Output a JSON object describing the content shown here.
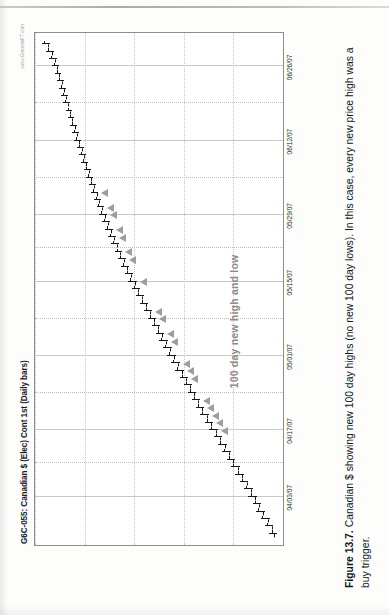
{
  "page": {
    "kind": "book-page-scan"
  },
  "caption": {
    "label": "Figure 13.7.",
    "text": "Canadian $ showing new 100 day highs (no new 100 day lows). In this case, every new price high was a buy trigger."
  },
  "chart_meta": {
    "title": "G6C-055: Canadian $ (Elec) Cont 1st (Daily bars)",
    "watermark": "www.GenesisFT.com",
    "annotation": "100 day new high and low",
    "bar_color": "#18181a",
    "trigger_color": "#9d9d9d",
    "grid_color": "#bdbdbd",
    "frame_color": "#8d8d8d"
  },
  "chart_data": {
    "type": "ohlc",
    "title": "G6C-055: Canadian $ (Elec) Cont 1st (Daily bars)",
    "xlabel": "",
    "ylabel": "",
    "grid": true,
    "legend": "none",
    "orientation": "page-rotated-90-ccw",
    "xlim": [
      "03/26/07",
      "07/03/07"
    ],
    "ylim": [
      0.855,
      0.955
    ],
    "xticks": [
      "04/03/07",
      "04/17/07",
      "05/01/07",
      "05/15/07",
      "05/29/07",
      "06/12/07",
      "06/26/07"
    ],
    "annotations": [
      {
        "text": "100 day new high and low",
        "x": "05/02/07",
        "y": 0.874
      }
    ],
    "series": [
      {
        "name": "Canadian $ Continuous 1st",
        "bars": [
          {
            "date": "03/27/07",
            "open": 0.8588,
            "high": 0.8605,
            "low": 0.8575,
            "close": 0.8596,
            "trigger": false
          },
          {
            "date": "03/28/07",
            "open": 0.8596,
            "high": 0.8622,
            "low": 0.859,
            "close": 0.8614,
            "trigger": false
          },
          {
            "date": "03/29/07",
            "open": 0.8612,
            "high": 0.864,
            "low": 0.8604,
            "close": 0.8633,
            "trigger": false
          },
          {
            "date": "03/30/07",
            "open": 0.8631,
            "high": 0.8658,
            "low": 0.8622,
            "close": 0.865,
            "trigger": false
          },
          {
            "date": "04/02/07",
            "open": 0.8648,
            "high": 0.8672,
            "low": 0.8639,
            "close": 0.8662,
            "trigger": false
          },
          {
            "date": "04/03/07",
            "open": 0.8661,
            "high": 0.869,
            "low": 0.8654,
            "close": 0.8681,
            "trigger": false
          },
          {
            "date": "04/04/07",
            "open": 0.868,
            "high": 0.8706,
            "low": 0.8671,
            "close": 0.8698,
            "trigger": false
          },
          {
            "date": "04/05/07",
            "open": 0.8697,
            "high": 0.8724,
            "low": 0.869,
            "close": 0.8716,
            "trigger": false
          },
          {
            "date": "04/09/07",
            "open": 0.8715,
            "high": 0.8742,
            "low": 0.8707,
            "close": 0.8733,
            "trigger": false
          },
          {
            "date": "04/10/07",
            "open": 0.8732,
            "high": 0.876,
            "low": 0.8724,
            "close": 0.8752,
            "trigger": false
          },
          {
            "date": "04/11/07",
            "open": 0.875,
            "high": 0.8776,
            "low": 0.8742,
            "close": 0.8768,
            "trigger": false
          },
          {
            "date": "04/12/07",
            "open": 0.8767,
            "high": 0.8795,
            "low": 0.8759,
            "close": 0.8786,
            "trigger": false
          },
          {
            "date": "04/13/07",
            "open": 0.8785,
            "high": 0.8812,
            "low": 0.8777,
            "close": 0.8804,
            "trigger": false
          },
          {
            "date": "04/16/07",
            "open": 0.8803,
            "high": 0.883,
            "low": 0.8795,
            "close": 0.8822,
            "trigger": false
          },
          {
            "date": "04/17/07",
            "open": 0.8821,
            "high": 0.8848,
            "low": 0.8813,
            "close": 0.884,
            "trigger": true
          },
          {
            "date": "04/18/07",
            "open": 0.8839,
            "high": 0.8866,
            "low": 0.8831,
            "close": 0.8858,
            "trigger": true
          },
          {
            "date": "04/19/07",
            "open": 0.8857,
            "high": 0.8884,
            "low": 0.8849,
            "close": 0.8876,
            "trigger": true
          },
          {
            "date": "04/20/07",
            "open": 0.8875,
            "high": 0.8902,
            "low": 0.8867,
            "close": 0.8894,
            "trigger": true
          },
          {
            "date": "04/23/07",
            "open": 0.8893,
            "high": 0.8918,
            "low": 0.8884,
            "close": 0.891,
            "trigger": true
          },
          {
            "date": "04/24/07",
            "open": 0.8908,
            "high": 0.8934,
            "low": 0.89,
            "close": 0.8926,
            "trigger": false
          },
          {
            "date": "04/25/07",
            "open": 0.8925,
            "high": 0.895,
            "low": 0.8916,
            "close": 0.8942,
            "trigger": false
          },
          {
            "date": "04/26/07",
            "open": 0.894,
            "high": 0.8966,
            "low": 0.8932,
            "close": 0.8958,
            "trigger": true
          },
          {
            "date": "04/27/07",
            "open": 0.8957,
            "high": 0.8984,
            "low": 0.8949,
            "close": 0.8976,
            "trigger": true
          },
          {
            "date": "04/30/07",
            "open": 0.8974,
            "high": 0.9,
            "low": 0.8966,
            "close": 0.8992,
            "trigger": true
          },
          {
            "date": "05/01/07",
            "open": 0.899,
            "high": 0.9016,
            "low": 0.8982,
            "close": 0.9008,
            "trigger": false
          },
          {
            "date": "05/02/07",
            "open": 0.9007,
            "high": 0.9032,
            "low": 0.8998,
            "close": 0.9024,
            "trigger": false
          },
          {
            "date": "05/03/07",
            "open": 0.9022,
            "high": 0.9048,
            "low": 0.9014,
            "close": 0.904,
            "trigger": true
          },
          {
            "date": "05/04/07",
            "open": 0.9038,
            "high": 0.9064,
            "low": 0.903,
            "close": 0.9056,
            "trigger": true
          },
          {
            "date": "05/07/07",
            "open": 0.9055,
            "high": 0.908,
            "low": 0.9046,
            "close": 0.9072,
            "trigger": false
          },
          {
            "date": "05/08/07",
            "open": 0.907,
            "high": 0.9096,
            "low": 0.9062,
            "close": 0.9088,
            "trigger": true
          },
          {
            "date": "05/09/07",
            "open": 0.9086,
            "high": 0.9112,
            "low": 0.9078,
            "close": 0.9104,
            "trigger": true
          },
          {
            "date": "05/10/07",
            "open": 0.9103,
            "high": 0.9128,
            "low": 0.9094,
            "close": 0.912,
            "trigger": false
          },
          {
            "date": "05/11/07",
            "open": 0.9118,
            "high": 0.9144,
            "low": 0.911,
            "close": 0.9136,
            "trigger": false
          },
          {
            "date": "05/14/07",
            "open": 0.9134,
            "high": 0.9158,
            "low": 0.9126,
            "close": 0.915,
            "trigger": false
          },
          {
            "date": "05/15/07",
            "open": 0.9148,
            "high": 0.9174,
            "low": 0.914,
            "close": 0.9166,
            "trigger": true
          },
          {
            "date": "05/16/07",
            "open": 0.9164,
            "high": 0.9188,
            "low": 0.9156,
            "close": 0.918,
            "trigger": false
          },
          {
            "date": "05/17/07",
            "open": 0.9178,
            "high": 0.9202,
            "low": 0.917,
            "close": 0.9194,
            "trigger": false
          },
          {
            "date": "05/18/07",
            "open": 0.9192,
            "high": 0.9216,
            "low": 0.9184,
            "close": 0.9208,
            "trigger": true
          },
          {
            "date": "05/21/07",
            "open": 0.9206,
            "high": 0.9228,
            "low": 0.9198,
            "close": 0.922,
            "trigger": true
          },
          {
            "date": "05/22/07",
            "open": 0.9219,
            "high": 0.9242,
            "low": 0.9211,
            "close": 0.9234,
            "trigger": false
          },
          {
            "date": "05/23/07",
            "open": 0.9232,
            "high": 0.9254,
            "low": 0.9224,
            "close": 0.9246,
            "trigger": true
          },
          {
            "date": "05/24/07",
            "open": 0.9244,
            "high": 0.9266,
            "low": 0.9236,
            "close": 0.9258,
            "trigger": true
          },
          {
            "date": "05/25/07",
            "open": 0.9256,
            "high": 0.9278,
            "low": 0.9248,
            "close": 0.927,
            "trigger": false
          },
          {
            "date": "05/29/07",
            "open": 0.9268,
            "high": 0.929,
            "low": 0.926,
            "close": 0.9282,
            "trigger": true
          },
          {
            "date": "05/30/07",
            "open": 0.928,
            "high": 0.9302,
            "low": 0.9272,
            "close": 0.9294,
            "trigger": true
          },
          {
            "date": "05/31/07",
            "open": 0.9292,
            "high": 0.9312,
            "low": 0.9284,
            "close": 0.9304,
            "trigger": false
          },
          {
            "date": "06/01/07",
            "open": 0.9302,
            "high": 0.9324,
            "low": 0.9294,
            "close": 0.9316,
            "trigger": true
          },
          {
            "date": "06/04/07",
            "open": 0.9314,
            "high": 0.9334,
            "low": 0.9306,
            "close": 0.9326,
            "trigger": false
          },
          {
            "date": "06/05/07",
            "open": 0.9324,
            "high": 0.9344,
            "low": 0.9316,
            "close": 0.9336,
            "trigger": false
          },
          {
            "date": "06/06/07",
            "open": 0.9334,
            "high": 0.9354,
            "low": 0.9326,
            "close": 0.9346,
            "trigger": false
          },
          {
            "date": "06/07/07",
            "open": 0.9344,
            "high": 0.9364,
            "low": 0.9336,
            "close": 0.9356,
            "trigger": false
          },
          {
            "date": "06/08/07",
            "open": 0.9354,
            "high": 0.9372,
            "low": 0.9346,
            "close": 0.9364,
            "trigger": false
          },
          {
            "date": "06/11/07",
            "open": 0.9362,
            "high": 0.9382,
            "low": 0.9354,
            "close": 0.9374,
            "trigger": false
          },
          {
            "date": "06/12/07",
            "open": 0.9372,
            "high": 0.9392,
            "low": 0.9364,
            "close": 0.9384,
            "trigger": false
          },
          {
            "date": "06/13/07",
            "open": 0.9382,
            "high": 0.94,
            "low": 0.9374,
            "close": 0.9392,
            "trigger": false
          },
          {
            "date": "06/14/07",
            "open": 0.939,
            "high": 0.941,
            "low": 0.9382,
            "close": 0.9402,
            "trigger": false
          },
          {
            "date": "06/15/07",
            "open": 0.94,
            "high": 0.9418,
            "low": 0.9392,
            "close": 0.941,
            "trigger": false
          },
          {
            "date": "06/18/07",
            "open": 0.9408,
            "high": 0.9426,
            "low": 0.94,
            "close": 0.9418,
            "trigger": false
          },
          {
            "date": "06/19/07",
            "open": 0.9416,
            "high": 0.9436,
            "low": 0.9408,
            "close": 0.9428,
            "trigger": false
          },
          {
            "date": "06/20/07",
            "open": 0.9426,
            "high": 0.9444,
            "low": 0.9418,
            "close": 0.9436,
            "trigger": false
          },
          {
            "date": "06/21/07",
            "open": 0.9434,
            "high": 0.9452,
            "low": 0.9426,
            "close": 0.9444,
            "trigger": false
          },
          {
            "date": "06/22/07",
            "open": 0.9442,
            "high": 0.9462,
            "low": 0.9434,
            "close": 0.9454,
            "trigger": false
          },
          {
            "date": "06/25/07",
            "open": 0.9452,
            "high": 0.947,
            "low": 0.9444,
            "close": 0.9462,
            "trigger": false
          },
          {
            "date": "06/26/07",
            "open": 0.946,
            "high": 0.948,
            "low": 0.9452,
            "close": 0.9472,
            "trigger": false
          },
          {
            "date": "06/27/07",
            "open": 0.947,
            "high": 0.9492,
            "low": 0.9462,
            "close": 0.9484,
            "trigger": false
          },
          {
            "date": "06/28/07",
            "open": 0.9482,
            "high": 0.9506,
            "low": 0.9474,
            "close": 0.9498,
            "trigger": false
          },
          {
            "date": "06/29/07",
            "open": 0.9496,
            "high": 0.952,
            "low": 0.9488,
            "close": 0.9512,
            "trigger": false
          }
        ]
      }
    ]
  }
}
